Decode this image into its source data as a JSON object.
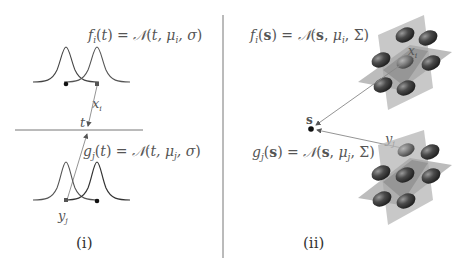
{
  "panels": [
    {
      "id": "i",
      "caption": "(i)",
      "top_formula": "fᵢ(t) = 𝒩(t, μᵢ, σ)",
      "bottom_formula": "gⱼ(t) = 𝒩(t, μⱼ, σ)",
      "point_labels": {
        "x": "xᵢ",
        "t": "t",
        "y": "yⱼ"
      },
      "description": "Two pairs of 1D Gaussian curves; arrows from x_i (top) and y_j (bottom) meet at point t on a horizontal axis"
    },
    {
      "id": "ii",
      "caption": "(ii)",
      "top_formula": "fᵢ(s) = 𝒩(s, μᵢ, Σ)",
      "bottom_formula": "gⱼ(s) = 𝒩(s, μⱼ, Σ)",
      "point_labels": {
        "x": "xᵢ",
        "s": "s",
        "y": "yⱼ"
      },
      "description": "Two 3D lattices of ellipsoidal Gaussian blobs on crossing planes; arrows from x_i and y_j point to s"
    }
  ],
  "colors": {
    "curve": "#444444",
    "divider": "#777777",
    "plane": "#b8b8b8",
    "plane_dark": "#8a8a8a",
    "blob": "#3a3a3a",
    "arrow": "#888888"
  }
}
